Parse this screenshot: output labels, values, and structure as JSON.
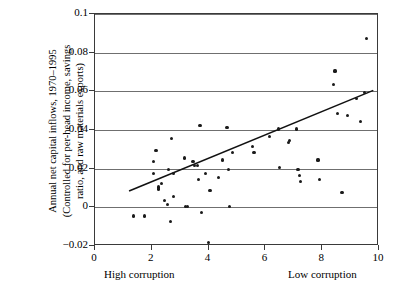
{
  "chart_data": {
    "type": "scatter",
    "title": "",
    "xlabel": "",
    "ylabel": "Annual net capital inflows, 1970–1995\n(Controlled for per-head income, savings\nratio, and raw materials exports)",
    "xlim": [
      0,
      10
    ],
    "ylim": [
      -0.02,
      0.1
    ],
    "xticks": [
      0,
      2,
      4,
      6,
      8,
      10
    ],
    "xtick_labels": [
      "0",
      "2",
      "4",
      "6",
      "8",
      "10"
    ],
    "yticks": [
      -0.02,
      0,
      0.02,
      0.04,
      0.06,
      0.08,
      0.1
    ],
    "ytick_labels": [
      "−0.02",
      "0",
      "0.02",
      "0.04",
      "0.06",
      "0.08",
      "0.1"
    ],
    "grid": "horizontal",
    "legend": "none",
    "axis_annotations": {
      "left": "High corruption",
      "right": "Low corruption"
    },
    "marker_color": "#1a1a1a",
    "gridline_color": "#6f6f6f",
    "frame_color": "#3a3a3a",
    "trendline": {
      "color": "#111111",
      "x": [
        1.2,
        9.8
      ],
      "y": [
        0.0085,
        0.0605
      ]
    },
    "points": [
      {
        "x": 1.35,
        "y": -0.0045
      },
      {
        "x": 1.75,
        "y": -0.0045
      },
      {
        "x": 2.05,
        "y": 0.0235
      },
      {
        "x": 2.05,
        "y": 0.0175
      },
      {
        "x": 2.15,
        "y": 0.0295
      },
      {
        "x": 2.25,
        "y": 0.0105
      },
      {
        "x": 2.25,
        "y": 0.0095
      },
      {
        "x": 2.35,
        "y": 0.0125
      },
      {
        "x": 2.45,
        "y": 0.0035
      },
      {
        "x": 2.55,
        "y": 0.0015
      },
      {
        "x": 2.6,
        "y": 0.0195
      },
      {
        "x": 2.65,
        "y": -0.0075
      },
      {
        "x": 2.7,
        "y": 0.0355
      },
      {
        "x": 2.75,
        "y": 0.0055
      },
      {
        "x": 2.75,
        "y": 0.0175
      },
      {
        "x": 3.15,
        "y": 0.0255
      },
      {
        "x": 3.2,
        "y": 0.0005
      },
      {
        "x": 3.25,
        "y": 0.0005
      },
      {
        "x": 3.45,
        "y": 0.0235
      },
      {
        "x": 3.5,
        "y": 0.0215
      },
      {
        "x": 3.6,
        "y": 0.0215
      },
      {
        "x": 3.65,
        "y": 0.0145
      },
      {
        "x": 3.7,
        "y": 0.0425
      },
      {
        "x": 3.75,
        "y": -0.0025
      },
      {
        "x": 3.9,
        "y": 0.0175
      },
      {
        "x": 4.0,
        "y": -0.018
      },
      {
        "x": 4.05,
        "y": 0.0085
      },
      {
        "x": 4.35,
        "y": 0.0155
      },
      {
        "x": 4.5,
        "y": 0.0245
      },
      {
        "x": 4.65,
        "y": 0.0415
      },
      {
        "x": 4.7,
        "y": 0.0195
      },
      {
        "x": 4.75,
        "y": 0.0005
      },
      {
        "x": 4.85,
        "y": 0.0285
      },
      {
        "x": 5.55,
        "y": 0.0315
      },
      {
        "x": 5.6,
        "y": 0.0285
      },
      {
        "x": 6.15,
        "y": 0.0365
      },
      {
        "x": 6.45,
        "y": 0.0405
      },
      {
        "x": 6.5,
        "y": 0.0205
      },
      {
        "x": 6.8,
        "y": 0.0335
      },
      {
        "x": 6.85,
        "y": 0.0345
      },
      {
        "x": 7.1,
        "y": 0.0405
      },
      {
        "x": 7.15,
        "y": 0.0195
      },
      {
        "x": 7.2,
        "y": 0.0165
      },
      {
        "x": 7.25,
        "y": 0.0135
      },
      {
        "x": 7.85,
        "y": 0.0245
      },
      {
        "x": 7.9,
        "y": 0.0145
      },
      {
        "x": 8.4,
        "y": 0.0635
      },
      {
        "x": 8.45,
        "y": 0.0705
      },
      {
        "x": 8.55,
        "y": 0.0485
      },
      {
        "x": 8.7,
        "y": 0.0075
      },
      {
        "x": 8.9,
        "y": 0.0475
      },
      {
        "x": 9.2,
        "y": 0.0565
      },
      {
        "x": 9.35,
        "y": 0.0445
      },
      {
        "x": 9.5,
        "y": 0.0595
      },
      {
        "x": 9.55,
        "y": 0.0875
      }
    ]
  }
}
